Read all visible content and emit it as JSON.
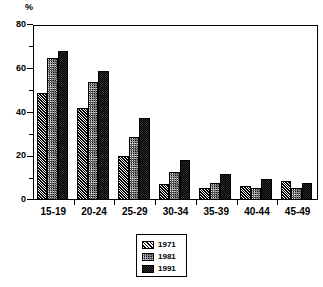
{
  "chart_data": {
    "type": "bar",
    "title": "",
    "subtitle": "",
    "xlabel": "",
    "ylabel": "%",
    "unit_label": "%",
    "categories": [
      "15-19",
      "20-24",
      "25-29",
      "30-34",
      "35-39",
      "40-44",
      "45-49"
    ],
    "series": [
      {
        "name": "1971",
        "pattern": "diagonal-hatch",
        "values": [
          49,
          42,
          20,
          7.5,
          5.5,
          6.5,
          8.5
        ]
      },
      {
        "name": "1981",
        "pattern": "stipple-dots",
        "values": [
          65,
          54,
          29,
          13,
          8,
          5.5,
          5.5
        ]
      },
      {
        "name": "1991",
        "pattern": "solid-black",
        "values": [
          68,
          59,
          37.5,
          18.5,
          12,
          9.5,
          8
        ]
      }
    ],
    "ylim": [
      0,
      80
    ],
    "ytick_values": [
      0,
      20,
      40,
      60,
      80
    ],
    "ytick_labels": [
      "0",
      "20",
      "40",
      "60",
      "80"
    ],
    "yminor_tick_values": [
      10,
      30,
      50,
      70
    ],
    "grid": false,
    "legend_position": "bottom-center",
    "legend_entries": [
      "1971",
      "1981",
      "1991"
    ]
  }
}
